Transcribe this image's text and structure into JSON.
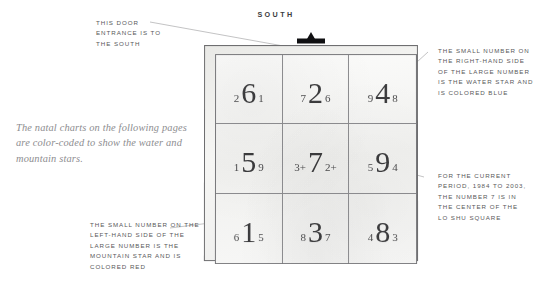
{
  "page": {
    "background_color": "#ffffff",
    "ink_color": "#58585a"
  },
  "compass": {
    "direction_label": "SOUTH"
  },
  "caption": {
    "text": "The natal charts on the following pages are color-coded to show the water and mountain stars."
  },
  "lo_shu": {
    "title": "Lo Shu square",
    "door_marker_name": "door-entrance-marker",
    "cells": [
      {
        "position": "top-left",
        "mountain_star": "2",
        "period_star": "6",
        "water_star": "1"
      },
      {
        "position": "top-center",
        "mountain_star": "7",
        "period_star": "2",
        "water_star": "6"
      },
      {
        "position": "top-right",
        "mountain_star": "9",
        "period_star": "4",
        "water_star": "8"
      },
      {
        "position": "middle-left",
        "mountain_star": "1",
        "period_star": "5",
        "water_star": "9"
      },
      {
        "position": "middle-center",
        "mountain_star": "3+",
        "period_star": "7",
        "water_star": "2+"
      },
      {
        "position": "middle-right",
        "mountain_star": "5",
        "period_star": "9",
        "water_star": "4"
      },
      {
        "position": "bottom-left",
        "mountain_star": "6",
        "period_star": "1",
        "water_star": "5"
      },
      {
        "position": "bottom-center",
        "mountain_star": "8",
        "period_star": "3",
        "water_star": "7"
      },
      {
        "position": "bottom-right",
        "mountain_star": "4",
        "period_star": "8",
        "water_star": "3"
      }
    ]
  },
  "annotations": {
    "door": {
      "lines": [
        "THIS DOOR",
        "ENTRANCE IS TO",
        "THE SOUTH"
      ]
    },
    "water_star": {
      "lines": [
        "THE SMALL NUMBER ON",
        "THE RIGHT-HAND SIDE",
        "OF THE LARGE NUMBER",
        "IS THE WATER STAR AND",
        "IS COLORED BLUE"
      ]
    },
    "current_period": {
      "lines": [
        "FOR THE CURRENT",
        "PERIOD, 1984 TO 2003,",
        "THE NUMBER 7 IS IN",
        "THE CENTER OF THE",
        "LO SHU SQUARE"
      ]
    },
    "mountain_star": {
      "lines": [
        "THE SMALL NUMBER ON THE",
        "LEFT-HAND SIDE OF THE",
        "LARGE NUMBER IS THE",
        "MOUNTAIN STAR AND IS",
        "COLORED RED"
      ]
    }
  }
}
